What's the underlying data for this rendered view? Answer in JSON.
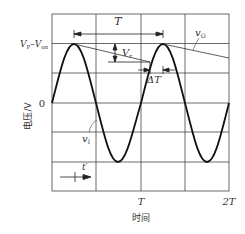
{
  "diagram": {
    "type": "half-wave rectifier with capacitor filter waveform",
    "y_axis": {
      "label": "电压/V",
      "ticks": [
        {
          "label": "V_P–V_on",
          "main": "V",
          "sub1": "P",
          "dash": "–",
          "main2": "V",
          "sub2": "on"
        },
        {
          "label": "0"
        }
      ]
    },
    "x_axis": {
      "label": "时间",
      "ticks": [
        {
          "label": "T"
        },
        {
          "label": "2T"
        }
      ]
    },
    "annotations": {
      "period": "T",
      "ripple": {
        "main": "V",
        "sub": "r"
      },
      "delta_t": "ΔT",
      "input_signal": {
        "main": "v",
        "sub": "I"
      },
      "output_signal": {
        "main": "v",
        "sub": "O"
      },
      "time_marker": "t′"
    },
    "colors": {
      "grid": "#333333",
      "curve": "#111111",
      "background": "#ffffff"
    }
  }
}
